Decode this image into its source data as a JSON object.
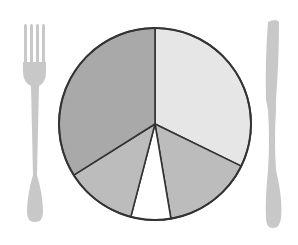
{
  "chart_data": {
    "type": "pie",
    "title": "",
    "start_angle_deg": 0,
    "direction": "clockwise",
    "slices": [
      {
        "label": "",
        "value": 32.2,
        "color": "#e6e6e6"
      },
      {
        "label": "",
        "value": 15.1,
        "color": "#bcbcbc"
      },
      {
        "label": "",
        "value": 6.7,
        "color": "#ffffff"
      },
      {
        "label": "",
        "value": 12.0,
        "color": "#bcbcbc"
      },
      {
        "label": "",
        "value": 33.9,
        "color": "#a9a9a9"
      }
    ],
    "values": [
      32.2,
      15.1,
      6.7,
      12.0,
      33.9
    ],
    "legend": [],
    "annotations": []
  },
  "decor": {
    "left_utensil": "fork-icon",
    "right_utensil": "knife-icon",
    "utensil_color": "#c8c8c8",
    "outline_color": "#333333"
  },
  "plate": {
    "cx": 155,
    "cy": 124,
    "r": 96
  }
}
